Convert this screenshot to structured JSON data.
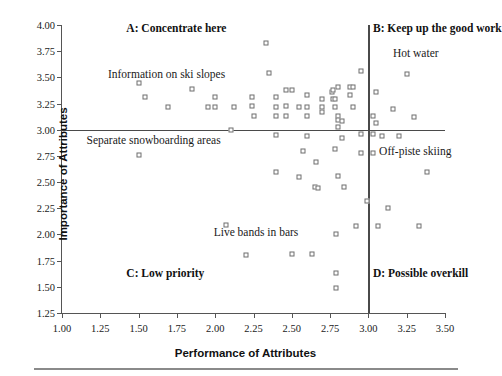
{
  "chart_data": {
    "type": "scatter",
    "title": "",
    "xlabel": "Performance of Attributes",
    "ylabel": "Importance of Attributes",
    "xlim": [
      1.0,
      3.5
    ],
    "ylim": [
      1.25,
      4.0
    ],
    "xticks": [
      "1.00",
      "1.25",
      "1.50",
      "1.75",
      "2.00",
      "2.25",
      "2.50",
      "2.75",
      "3.00",
      "3.25",
      "3.50"
    ],
    "yticks": [
      "4.00",
      "3.75",
      "3.50",
      "3.25",
      "3.00",
      "2.75",
      "2.50",
      "2.25",
      "2.00",
      "1.75",
      "1.50",
      "1.25"
    ],
    "xtick_values": [
      1.0,
      1.25,
      1.5,
      1.75,
      2.0,
      2.25,
      2.5,
      2.75,
      3.0,
      3.25,
      3.5
    ],
    "ytick_values": [
      4.0,
      3.75,
      3.5,
      3.25,
      3.0,
      2.75,
      2.5,
      2.25,
      2.0,
      1.75,
      1.5,
      1.25
    ],
    "grid": false,
    "legend": "none",
    "crosshair": {
      "x": 3.0,
      "y": 3.0
    },
    "quadrants": [
      {
        "id": "A",
        "label": "A: Concentrate here",
        "x": 1.42,
        "y": 3.96
      },
      {
        "id": "B",
        "label": "B: Keep up the good work",
        "x": 3.03,
        "y": 3.96
      },
      {
        "id": "C",
        "label": "C: Low priority",
        "x": 1.42,
        "y": 1.62
      },
      {
        "id": "D",
        "label": "D: Possible overkill",
        "x": 3.03,
        "y": 1.62
      }
    ],
    "annotations": [
      {
        "text": "Information on ski slopes",
        "x": 1.3,
        "y": 3.52
      },
      {
        "text": "Separate snowboarding areas",
        "x": 1.16,
        "y": 2.89
      },
      {
        "text": "Hot water",
        "x": 3.16,
        "y": 3.72
      },
      {
        "text": "Off-piste skiing",
        "x": 3.07,
        "y": 2.79
      },
      {
        "text": "Live bands in bars",
        "x": 1.99,
        "y": 2.01
      }
    ],
    "points": [
      [
        1.5,
        3.45
      ],
      [
        1.54,
        3.31
      ],
      [
        1.5,
        2.76
      ],
      [
        1.69,
        3.22
      ],
      [
        1.85,
        3.39
      ],
      [
        1.95,
        3.22
      ],
      [
        2.0,
        3.22
      ],
      [
        2.0,
        3.31
      ],
      [
        2.07,
        2.09
      ],
      [
        2.1,
        3.0
      ],
      [
        2.12,
        3.22
      ],
      [
        2.2,
        1.8
      ],
      [
        2.24,
        3.31
      ],
      [
        2.24,
        3.23
      ],
      [
        2.25,
        3.13
      ],
      [
        2.33,
        3.83
      ],
      [
        2.35,
        3.54
      ],
      [
        2.4,
        3.31
      ],
      [
        2.4,
        3.22
      ],
      [
        2.4,
        3.13
      ],
      [
        2.4,
        2.95
      ],
      [
        2.4,
        2.6
      ],
      [
        2.46,
        3.38
      ],
      [
        2.46,
        3.23
      ],
      [
        2.46,
        3.13
      ],
      [
        2.5,
        3.38
      ],
      [
        2.5,
        1.81
      ],
      [
        2.55,
        3.22
      ],
      [
        2.55,
        2.55
      ],
      [
        2.57,
        2.8
      ],
      [
        2.6,
        3.33
      ],
      [
        2.6,
        3.22
      ],
      [
        2.6,
        3.13
      ],
      [
        2.6,
        2.94
      ],
      [
        2.63,
        1.81
      ],
      [
        2.65,
        2.45
      ],
      [
        2.66,
        2.69
      ],
      [
        2.67,
        2.44
      ],
      [
        2.7,
        3.29
      ],
      [
        2.7,
        3.22
      ],
      [
        2.7,
        3.17
      ],
      [
        2.76,
        3.36
      ],
      [
        2.77,
        3.38
      ],
      [
        2.77,
        3.29
      ],
      [
        2.78,
        3.22
      ],
      [
        2.78,
        3.29
      ],
      [
        2.78,
        2.82
      ],
      [
        2.79,
        2.0
      ],
      [
        2.79,
        1.63
      ],
      [
        2.79,
        1.49
      ],
      [
        2.8,
        3.41
      ],
      [
        2.8,
        3.13
      ],
      [
        2.8,
        3.09
      ],
      [
        2.8,
        3.03
      ],
      [
        2.8,
        2.56
      ],
      [
        2.83,
        3.08
      ],
      [
        2.83,
        2.92
      ],
      [
        2.84,
        2.45
      ],
      [
        2.88,
        3.41
      ],
      [
        2.88,
        3.33
      ],
      [
        2.9,
        3.41
      ],
      [
        2.9,
        3.22
      ],
      [
        2.92,
        2.08
      ],
      [
        2.95,
        3.56
      ],
      [
        2.95,
        2.96
      ],
      [
        2.95,
        2.78
      ],
      [
        2.99,
        2.32
      ],
      [
        3.03,
        3.13
      ],
      [
        3.03,
        2.96
      ],
      [
        3.03,
        2.78
      ],
      [
        3.05,
        3.36
      ],
      [
        3.05,
        3.06
      ],
      [
        3.06,
        2.08
      ],
      [
        3.09,
        2.94
      ],
      [
        3.13,
        2.25
      ],
      [
        3.16,
        3.2
      ],
      [
        3.2,
        2.94
      ],
      [
        3.25,
        3.53
      ],
      [
        3.3,
        3.12
      ],
      [
        3.33,
        2.08
      ],
      [
        3.38,
        2.6
      ]
    ]
  }
}
